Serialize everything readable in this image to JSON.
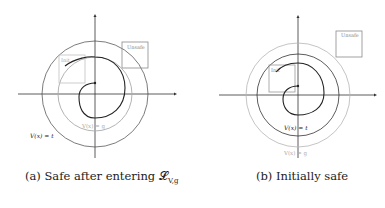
{
  "figures": [
    {
      "id": "a",
      "caption": "(a) Safe after entering 𝓛",
      "caption_sub": "V,g",
      "labels": {
        "unsafe": "Unsafe",
        "init": "Init",
        "level_g": "V(x) = g",
        "level_t": "V(x) = t"
      }
    },
    {
      "id": "b",
      "caption": "(b) Initially safe",
      "labels": {
        "unsafe": "Unsafe",
        "init": "Init",
        "level_t": "V(x) = t",
        "level_g": "V(x) = g"
      }
    }
  ],
  "colors": {
    "axis": "#333333",
    "dark_curve": "#2a2a2a",
    "gray_curve": "#9a9a9a",
    "box": "#8a8a8a",
    "light_box": "#bdbdbd"
  }
}
